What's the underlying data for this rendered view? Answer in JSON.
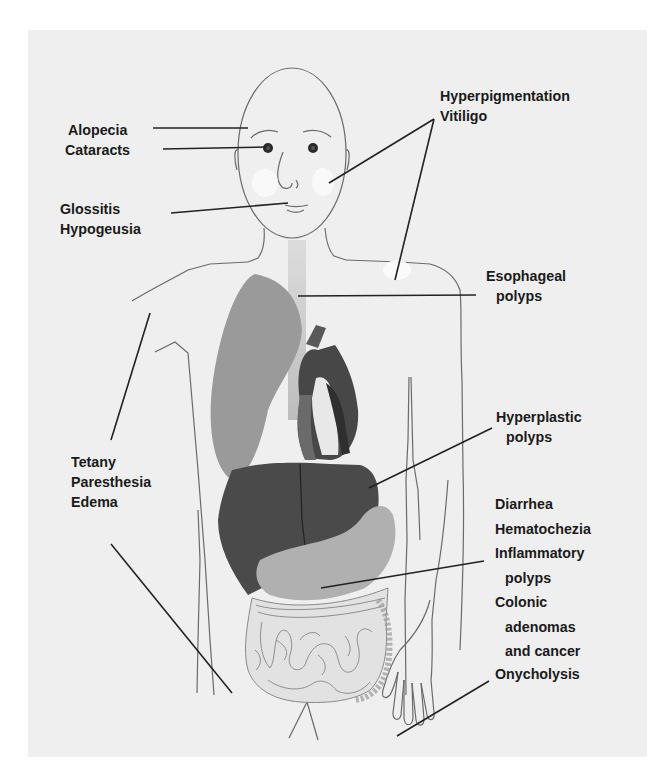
{
  "figure": {
    "type": "anatomical-diagram",
    "colors": {
      "background": "#efefef",
      "outline": "#6a6a6a",
      "leader_line": "#222222",
      "lung": "#9a9a9a",
      "heart_dark": "#3c3c3c",
      "liver": "#4a4a4a",
      "stomach": "#b0b0b0",
      "esophagus": "#c4c4c4",
      "intestine": "#e2e2e2",
      "depigmented_patch": "#fbfbfb"
    }
  },
  "labels": {
    "alopecia": "Alopecia",
    "cataracts": "Cataracts",
    "glossitis": "Glossitis",
    "hypogeusia": "Hypogeusia",
    "hyperpigmentation": "Hyperpigmentation",
    "vitiligo": "Vitiligo",
    "esophageal_1": "Esophageal",
    "esophageal_2": "polyps",
    "tetany": "Tetany",
    "paresthesia": "Paresthesia",
    "edema": "Edema",
    "hyperplastic_1": "Hyperplastic",
    "hyperplastic_2": "polyps",
    "diarrhea": "Diarrhea",
    "hematochezia": "Hematochezia",
    "inflammatory_1": "Inflammatory",
    "inflammatory_2": "polyps",
    "colonic_1": "Colonic",
    "colonic_2": "adenomas",
    "colonic_3": "and cancer",
    "onycholysis": "Onycholysis"
  }
}
